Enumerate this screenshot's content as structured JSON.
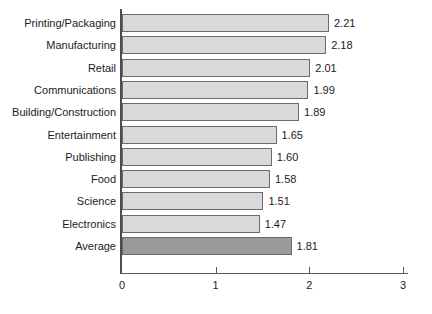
{
  "chart_data": {
    "type": "bar",
    "orientation": "horizontal",
    "title": "",
    "subtitle": "",
    "xlabel": "",
    "ylabel": "",
    "xlim": [
      0,
      3
    ],
    "xticks": [
      "0",
      "1",
      "2",
      "3"
    ],
    "grid": false,
    "legend": null,
    "categories": [
      "Printing/Packaging",
      "Manufacturing",
      "Retail",
      "Communications",
      "Building/Construction",
      "Entertainment",
      "Publishing",
      "Food",
      "Science",
      "Electronics",
      "Average"
    ],
    "values": [
      2.21,
      2.18,
      2.01,
      1.99,
      1.89,
      1.65,
      1.6,
      1.58,
      1.51,
      1.47,
      1.81
    ],
    "value_labels": [
      "2.21",
      "2.18",
      "2.01",
      "1.99",
      "1.89",
      "1.65",
      "1.60",
      "1.58",
      "1.51",
      "1.47",
      "1.81"
    ],
    "highlight_index": 10,
    "colors": {
      "bar_fill": "#d9d9d9",
      "bar_highlight_fill": "#9a9a9a",
      "bar_border": "#6b6b6b",
      "axis": "#5a5a5a",
      "text": "#1b1b1b",
      "background": "#ffffff"
    }
  }
}
